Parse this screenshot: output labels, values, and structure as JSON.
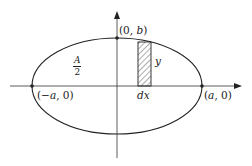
{
  "diagram": {
    "type": "ellipse-area-integration",
    "colors": {
      "stroke": "#222222",
      "background": "#ffffff"
    },
    "axes": {
      "x_axis": {
        "arrow": true
      },
      "y_axis": {
        "arrow": true
      }
    },
    "ellipse": {
      "center": [
        117,
        86
      ],
      "rx": 85,
      "ry": 48
    },
    "strip": {
      "hatched": true,
      "x": 138,
      "y": 42,
      "width": 13,
      "height": 44
    },
    "points": [
      {
        "id": "top",
        "label_prefix": "(0, ",
        "label_var": "b",
        "label_suffix": ")"
      },
      {
        "id": "left",
        "label": "(−a, 0)"
      },
      {
        "id": "right",
        "label": "(a, 0)"
      }
    ],
    "labels": {
      "top_point_open": "(0, ",
      "top_point_var": "b",
      "top_point_close": ")",
      "left_point_open": "(−",
      "left_point_var": "a",
      "left_point_close": ", 0)",
      "right_point_open": "(",
      "right_point_var": "a",
      "right_point_close": ", 0)",
      "area_numerator": "A",
      "area_denominator": "2",
      "strip_height": "y",
      "strip_width": "dx"
    }
  }
}
